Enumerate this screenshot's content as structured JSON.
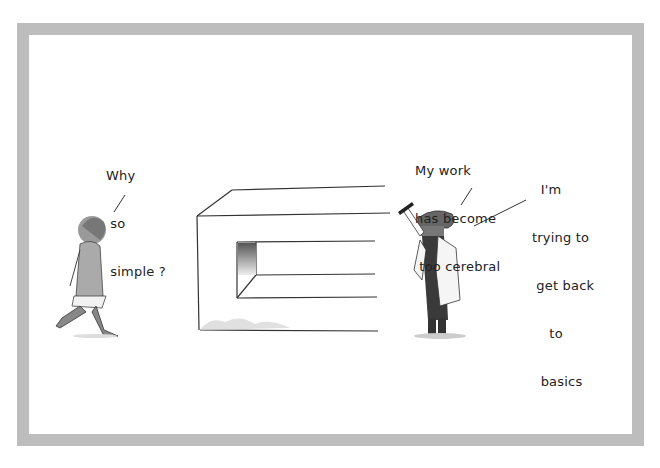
{
  "cartoon": {
    "frame_color": "#bdbdbd",
    "ink_color": "#222222",
    "speech": {
      "woman": {
        "lines": [
          "Why",
          " so",
          " simple ?"
        ]
      },
      "artist_left": {
        "lines": [
          "My work",
          "has become",
          " too cerebral"
        ]
      },
      "artist_right": {
        "lines": [
          "  I'm",
          "trying to",
          " get back",
          "    to",
          "  basics"
        ]
      }
    }
  }
}
